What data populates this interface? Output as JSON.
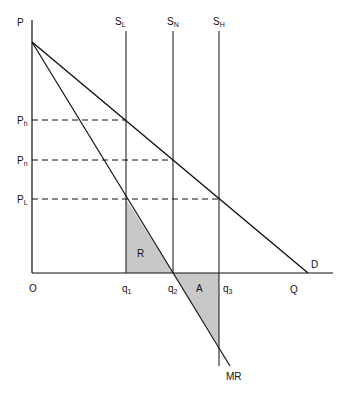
{
  "diagram": {
    "axes": {
      "y_label": "P",
      "x_label": "Q",
      "origin": "O"
    },
    "price_levels": [
      {
        "id": "Ph",
        "base": "P",
        "sub": "h"
      },
      {
        "id": "Pn",
        "base": "P",
        "sub": "n"
      },
      {
        "id": "PL",
        "base": "P",
        "sub": "L"
      }
    ],
    "supply_curves": [
      {
        "id": "SL",
        "base": "S",
        "sub": "L"
      },
      {
        "id": "SN",
        "base": "S",
        "sub": "N"
      },
      {
        "id": "SH",
        "base": "S",
        "sub": "H"
      }
    ],
    "quantities": [
      {
        "id": "q1",
        "base": "q",
        "sub": "1"
      },
      {
        "id": "q2",
        "base": "q",
        "sub": "2"
      },
      {
        "id": "q3",
        "base": "q",
        "sub": "3"
      }
    ],
    "curves": {
      "demand": "D",
      "marginal_revenue": "MR"
    },
    "areas": {
      "R": "R",
      "A": "A"
    },
    "colors": {
      "line": "#111111",
      "shade": "#c8c8c8"
    }
  }
}
